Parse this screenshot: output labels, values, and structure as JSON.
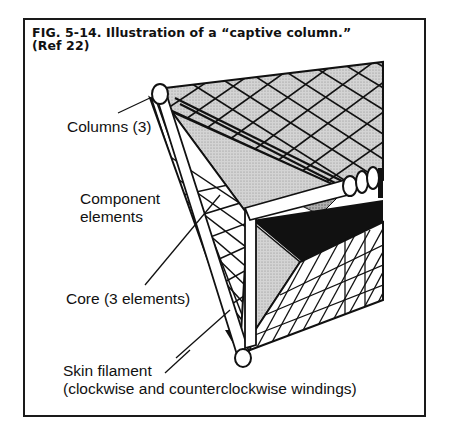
{
  "figure": {
    "number": "FIG. 5-14.",
    "title": "Illustration of a “captive column.”",
    "reference": "(Ref 22)"
  },
  "labels": {
    "columns": "Columns (3)",
    "component_line1": "Component",
    "component_line2": "elements",
    "core": "Core (3 elements)",
    "skin_line1": "Skin filament",
    "skin_line2": "(clockwise and counterclockwise windings)"
  },
  "colors": {
    "ink": "#111111",
    "shade": "#bdbdbd",
    "background": "#ffffff"
  }
}
